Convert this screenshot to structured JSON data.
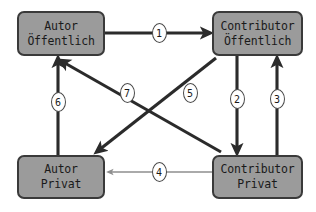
{
  "diagram": {
    "type": "directed-graph",
    "background_color": "#ffffff",
    "node_fill_color": "#9b9b9b",
    "node_border_color": "#3a3a3a",
    "edge_color": "#2b2b2b",
    "secondary_edge_color": "#8e8e8e",
    "nodes": [
      {
        "id": "autor-oeffentlich",
        "line1": "Autor",
        "line2": "Öffentlich",
        "x": 17,
        "y": 11,
        "w": 88,
        "h": 45
      },
      {
        "id": "contributor-oeffentlich",
        "line1": "Contributor",
        "line2": "Öffentlich",
        "x": 212,
        "y": 11,
        "w": 91,
        "h": 45
      },
      {
        "id": "autor-privat",
        "line1": "Autor",
        "line2": "Privat",
        "x": 17,
        "y": 155,
        "w": 88,
        "h": 44
      },
      {
        "id": "contributor-privat",
        "line1": "Contributor",
        "line2": "Privat",
        "x": 212,
        "y": 155,
        "w": 91,
        "h": 44
      }
    ],
    "edges": [
      {
        "id": "edge-1",
        "label": "1",
        "from": "autor-oeffentlich",
        "to": "contributor-oeffentlich",
        "style": "thick",
        "label_x": 159,
        "label_y": 33
      },
      {
        "id": "edge-2",
        "label": "2",
        "from": "contributor-oeffentlich",
        "to": "contributor-privat",
        "style": "thick",
        "label_x": 237,
        "label_y": 99
      },
      {
        "id": "edge-3",
        "label": "3",
        "from": "contributor-privat",
        "to": "contributor-oeffentlich",
        "style": "thick",
        "label_x": 277,
        "label_y": 99
      },
      {
        "id": "edge-4",
        "label": "4",
        "from": "contributor-privat",
        "to": "autor-privat",
        "style": "thin",
        "label_x": 159,
        "label_y": 172
      },
      {
        "id": "edge-5",
        "label": "5",
        "from": "contributor-privat",
        "to": "autor-oeffentlich",
        "style": "thick",
        "label_x": 190,
        "label_y": 93
      },
      {
        "id": "edge-6",
        "label": "6",
        "from": "autor-privat",
        "to": "autor-oeffentlich",
        "style": "thick",
        "label_x": 58,
        "label_y": 102
      },
      {
        "id": "edge-7",
        "label": "7",
        "from": "contributor-oeffentlich",
        "to": "autor-privat",
        "style": "thick",
        "label_x": 127,
        "label_y": 93
      }
    ]
  }
}
